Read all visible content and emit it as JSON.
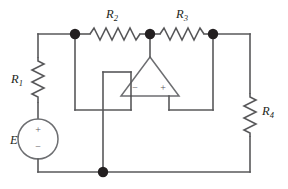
{
  "figure": {
    "background_color": "#ffffff",
    "wire_color": "#58585a",
    "node_color": "#231f20",
    "label_color": "#231f20"
  },
  "components": {
    "r1": {
      "label": "R",
      "subscript": "1",
      "type": "resistor",
      "orientation": "vertical"
    },
    "r2": {
      "label": "R",
      "subscript": "2",
      "type": "resistor",
      "orientation": "horizontal"
    },
    "r3": {
      "label": "R",
      "subscript": "3",
      "type": "resistor",
      "orientation": "horizontal"
    },
    "r4": {
      "label": "R",
      "subscript": "4",
      "type": "resistor",
      "orientation": "vertical"
    },
    "source": {
      "label": "E",
      "type": "voltage-source",
      "plus_sign": "+",
      "minus_sign": "−"
    },
    "opamp": {
      "type": "operational-amplifier",
      "orientation": "apex-up",
      "inverting_sign": "−",
      "noninverting_sign": "+"
    }
  },
  "nodes": [
    {
      "name": "node-left-top",
      "x": 75,
      "y": 34
    },
    {
      "name": "node-mid-top",
      "x": 150,
      "y": 34
    },
    {
      "name": "node-right-top",
      "x": 213,
      "y": 34
    },
    {
      "name": "node-bottom",
      "x": 103,
      "y": 172
    }
  ]
}
